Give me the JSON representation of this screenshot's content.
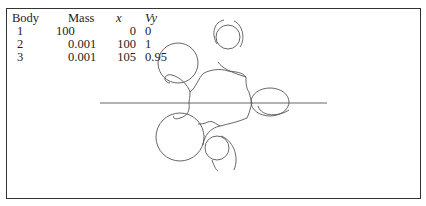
{
  "table": {
    "headers": [
      "Body",
      "Mass",
      "x",
      "Vy"
    ],
    "rows": [
      {
        "body": "1",
        "mass": "100",
        "x": "0",
        "vy": "0"
      },
      {
        "body": "2",
        "mass": "0.001",
        "x": "100",
        "vy": "1"
      },
      {
        "body": "3",
        "mass": "0.001",
        "x": "105",
        "vy": "0.95"
      }
    ]
  },
  "plot": {
    "description": "Orbit trajectory of body 3 looping around body 2 while circling body 1",
    "axis_line": {
      "x1": 100,
      "x2": 327,
      "y": 103
    },
    "stroke_color": "#555555",
    "frame_color": "#333333"
  }
}
